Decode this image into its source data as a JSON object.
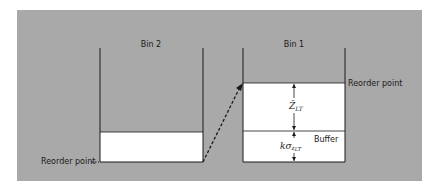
{
  "diagram": {
    "type": "two-bin inventory system",
    "bins": [
      {
        "id": "bin2",
        "label": "Bin 2",
        "annotation": "Reorder point"
      },
      {
        "id": "bin1",
        "label": "Bin 1",
        "annotation_top": "Reorder point",
        "annotation_buffer": "Buffer",
        "dimension_upper": {
          "symbol": "Z̄",
          "subscript": "LT"
        },
        "dimension_lower": {
          "symbol": "kσ",
          "sub_symbol": "z",
          "subscript": "LT"
        }
      }
    ],
    "colors": {
      "background_panel": "#a9a9a9",
      "bin_fill": "#ffffff",
      "line": "#1a1a1a"
    }
  }
}
